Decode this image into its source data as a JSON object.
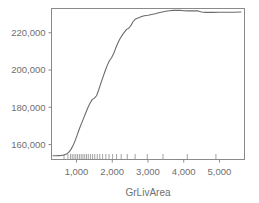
{
  "chart_data": {
    "type": "line",
    "title": "",
    "subtitle": "",
    "xlabel": "GrLivArea",
    "ylabel": "",
    "xlim": [
      300,
      5700
    ],
    "ylim": [
      152000,
      233000
    ],
    "grid": false,
    "legend": null,
    "x_ticks": [
      {
        "value": 1000,
        "label": "1,000"
      },
      {
        "value": 2000,
        "label": "2,000"
      },
      {
        "value": 3000,
        "label": "3,000"
      },
      {
        "value": 4000,
        "label": "4,000"
      },
      {
        "value": 5000,
        "label": "5,000"
      }
    ],
    "y_ticks": [
      {
        "value": 160000,
        "label": "160,000"
      },
      {
        "value": 180000,
        "label": "180,000"
      },
      {
        "value": 200000,
        "label": "200,000"
      },
      {
        "value": 220000,
        "label": "220,000"
      }
    ],
    "series": [
      {
        "name": "partial dependence",
        "color": "#6b6b6b",
        "x": [
          340,
          420,
          500,
          580,
          650,
          720,
          780,
          840,
          900,
          960,
          1020,
          1080,
          1140,
          1200,
          1260,
          1320,
          1380,
          1440,
          1500,
          1560,
          1620,
          1680,
          1740,
          1800,
          1860,
          1920,
          1980,
          2040,
          2100,
          2160,
          2220,
          2280,
          2340,
          2400,
          2460,
          2520,
          2580,
          2640,
          2700,
          2760,
          2820,
          2900,
          3000,
          3100,
          3200,
          3300,
          3400,
          3500,
          3600,
          3700,
          3800,
          3900,
          4000,
          4100,
          4200,
          4300,
          4400,
          4500,
          4600,
          4800,
          5000,
          5200,
          5400,
          5600
        ],
        "y": [
          154000,
          154000,
          154100,
          154200,
          154400,
          154900,
          155800,
          157300,
          159400,
          162000,
          165200,
          168500,
          171400,
          174200,
          177100,
          179900,
          182300,
          184100,
          184900,
          186200,
          189300,
          192800,
          196200,
          199500,
          202500,
          205000,
          206600,
          208900,
          211900,
          214600,
          216900,
          218700,
          220300,
          221800,
          222400,
          223800,
          225900,
          227200,
          227800,
          228200,
          228700,
          229100,
          229400,
          229800,
          230200,
          230700,
          231100,
          231500,
          231800,
          232000,
          232100,
          232000,
          231800,
          231700,
          231700,
          231800,
          231700,
          231100,
          230900,
          230900,
          231000,
          231000,
          231000,
          231100
        ]
      }
    ],
    "rug_values": [
      650,
      760,
      830,
      880,
      930,
      980,
      1030,
      1080,
      1130,
      1180,
      1230,
      1280,
      1330,
      1390,
      1450,
      1510,
      1580,
      1650,
      1730,
      1820,
      1910,
      2010,
      2120,
      2250,
      2420,
      2640,
      2980,
      3420,
      4100,
      4900
    ]
  },
  "axes": {
    "x_axis_title": "GrLivArea"
  },
  "colors": {
    "curve": "#6b6b6b",
    "frame": "#8a8a8a",
    "text": "#6f6f6f",
    "background": "#ffffff"
  }
}
